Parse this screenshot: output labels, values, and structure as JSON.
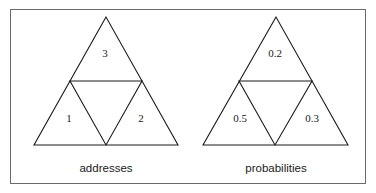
{
  "diagrams": [
    {
      "caption": "addresses",
      "regions": {
        "top": "3",
        "left": "1",
        "right": "2",
        "center": ""
      }
    },
    {
      "caption": "probabilities",
      "regions": {
        "top": "0.2",
        "left": "0.5",
        "right": "0.3",
        "center": ""
      }
    }
  ],
  "colors": {
    "stroke": "#1a1a1a",
    "frame": "#6a6a6a",
    "background": "#ffffff"
  }
}
